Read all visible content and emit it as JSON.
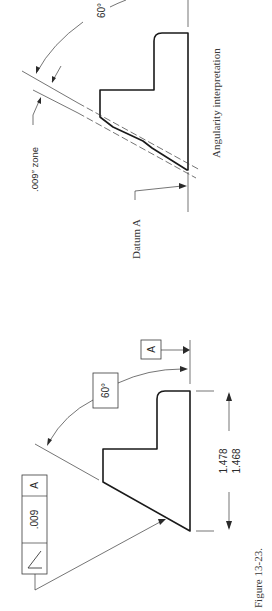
{
  "figure": {
    "caption": "Figure 13-23.",
    "orientation": "rotated 90 degrees counter-clockwise"
  },
  "drawing_callout": {
    "feature_control_frame": {
      "symbol": "angularity-symbol",
      "tolerance": ".009",
      "datum": "A"
    },
    "basic_angle": "60°",
    "datum_feature_label": "A",
    "dimension": {
      "upper_limit": "1.478",
      "lower_limit": "1.468"
    }
  },
  "interpretation": {
    "title": "Angularity interpretation",
    "zone_label": ".009″ zone",
    "datum_label": "Datum A",
    "angle_label": "60°"
  }
}
